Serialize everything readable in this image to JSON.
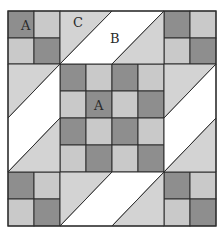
{
  "diagram": {
    "type": "quilt-block",
    "colors": {
      "dark": "#8e8e8e",
      "light": "#c9c9c9",
      "triangle": "#d3d3d3",
      "white": "#ffffff",
      "line": "#2e2e2e"
    },
    "labels": [
      {
        "text": "A",
        "x": 21,
        "y": 30,
        "piece": "dark-square-corner"
      },
      {
        "text": "C",
        "x": 73,
        "y": 27,
        "piece": "triangle"
      },
      {
        "text": "B",
        "x": 110,
        "y": 43,
        "piece": "parallelogram"
      },
      {
        "text": "A",
        "x": 94,
        "y": 110,
        "piece": "dark-square-center"
      }
    ],
    "grid": {
      "x": [
        8,
        34,
        60,
        86,
        112,
        138,
        164,
        190,
        216
      ],
      "y": [
        11,
        38,
        64,
        91,
        118,
        145,
        172,
        199,
        226
      ]
    },
    "four_patches": [
      {
        "position": "top-left",
        "cells": [
          [
            "dark",
            "light"
          ],
          [
            "light",
            "dark"
          ]
        ]
      },
      {
        "position": "top-right",
        "cells": [
          [
            "dark",
            "light"
          ],
          [
            "light",
            "dark"
          ]
        ]
      },
      {
        "position": "bottom-left",
        "cells": [
          [
            "dark",
            "light"
          ],
          [
            "light",
            "dark"
          ]
        ]
      },
      {
        "position": "bottom-right",
        "cells": [
          [
            "dark",
            "light"
          ],
          [
            "light",
            "dark"
          ]
        ]
      }
    ],
    "center_checkerboard": [
      [
        "dark",
        "light",
        "dark",
        "light"
      ],
      [
        "light",
        "dark",
        "light",
        "dark"
      ],
      [
        "dark",
        "light",
        "dark",
        "light"
      ],
      [
        "light",
        "dark",
        "light",
        "dark"
      ]
    ],
    "side_units": [
      "top",
      "left",
      "right",
      "bottom"
    ]
  }
}
